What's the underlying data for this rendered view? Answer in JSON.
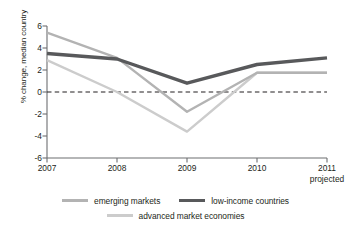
{
  "chart_data": {
    "type": "line",
    "title": "",
    "xlabel": "",
    "ylabel": "% change, median country",
    "x": [
      "2007",
      "2008",
      "2009",
      "2010",
      "2011"
    ],
    "x_tick_sublabel": "projected",
    "xlim": [
      2007,
      2011
    ],
    "ylim": [
      -6,
      6
    ],
    "ytick_labels": [
      "6",
      "4",
      "2",
      "0",
      "-2",
      "-4",
      "-6"
    ],
    "ytick_values": [
      6,
      4,
      2,
      0,
      -2,
      -4,
      -6
    ],
    "grid": false,
    "zero_line": true,
    "zero_line_style": "dashed",
    "legend_position": "bottom",
    "series": [
      {
        "name": "emerging markets",
        "color": "#b3b3b3",
        "width": 2.4,
        "values": [
          5.4,
          3.1,
          -1.8,
          1.75,
          1.75
        ]
      },
      {
        "name": "low-income countries",
        "color": "#58595b",
        "width": 3.4,
        "values": [
          3.5,
          3.0,
          0.8,
          2.5,
          3.1
        ]
      },
      {
        "name": "advanced market economies",
        "color": "#cccccc",
        "width": 2.4,
        "values": [
          2.9,
          0.0,
          -3.6,
          1.75,
          1.75
        ]
      }
    ]
  },
  "axes": {
    "axis_color": "#6d6e71",
    "zero_line_color": "#231f20",
    "text_color": "#231f20"
  }
}
